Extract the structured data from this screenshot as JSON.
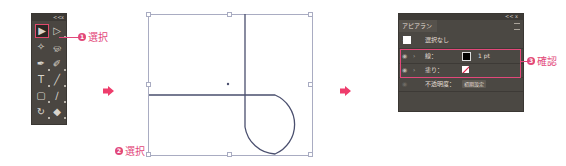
{
  "toolbox": {
    "title_controls": [
      "<<",
      "x"
    ],
    "tools": [
      {
        "name": "selection-tool",
        "glyph": "▶",
        "selected": true
      },
      {
        "name": "direct-selection-tool",
        "glyph": "▷",
        "selected": false
      },
      {
        "name": "magic-wand-tool",
        "glyph": "✧",
        "selected": false
      },
      {
        "name": "lasso-tool",
        "glyph": "ஓ",
        "selected": false
      },
      {
        "name": "pen-tool",
        "glyph": "✒",
        "selected": false
      },
      {
        "name": "curvature-tool",
        "glyph": "✐",
        "selected": false
      },
      {
        "name": "type-tool",
        "glyph": "T",
        "selected": false
      },
      {
        "name": "line-tool",
        "glyph": "╱",
        "selected": false
      },
      {
        "name": "rectangle-tool",
        "glyph": "▢",
        "selected": false
      },
      {
        "name": "brush-tool",
        "glyph": "∕",
        "selected": false
      },
      {
        "name": "rotate-tool",
        "glyph": "↻",
        "selected": false
      },
      {
        "name": "eraser-tool",
        "glyph": "◆",
        "selected": false
      }
    ]
  },
  "callouts": [
    {
      "number": "1",
      "label": "選択"
    },
    {
      "number": "2",
      "label": "選択"
    },
    {
      "number": "3",
      "label": "確認"
    }
  ],
  "colors": {
    "accent": "#e2487a",
    "arrow": "#ee3d6c",
    "path": "#4a4f6e",
    "bbox": "#a9acc2",
    "panel_bg": "#4b4843"
  },
  "appearance_panel": {
    "tab_label": "アピアランス",
    "title_controls": [
      "<<",
      "x"
    ],
    "object_label": "選択なし",
    "stroke": {
      "label": "線：",
      "weight": "1 pt"
    },
    "fill": {
      "label": "塗り："
    },
    "opacity": {
      "label": "不透明度：",
      "value": "初期設定"
    }
  }
}
